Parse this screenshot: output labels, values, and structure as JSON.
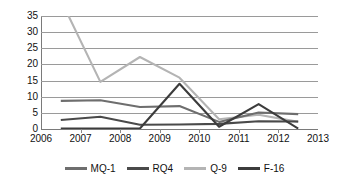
{
  "chart_data": {
    "type": "line",
    "title": "",
    "xlabel": "",
    "ylabel": "",
    "xlim": [
      2006,
      2013
    ],
    "ylim": [
      0,
      35
    ],
    "yticks": [
      0,
      5,
      10,
      15,
      20,
      25,
      30,
      35
    ],
    "xticks": [
      2006,
      2007,
      2008,
      2009,
      2010,
      2011,
      2012,
      2013
    ],
    "grid": true,
    "legend_position": "bottom",
    "note_clipped": "Q-9 value at 2006 exceeds the y-axis maximum of 35 and is clipped at the top of the plot area",
    "x": [
      2006,
      2007,
      2008,
      2009,
      2010,
      2011,
      2012
    ],
    "series": [
      {
        "name": "MQ-1",
        "color": "#6e6e6e",
        "values": [
          8.7,
          8.9,
          6.8,
          7.1,
          2.2,
          5.1,
          4.6
        ]
      },
      {
        "name": "RQ4",
        "color": "#4a4a4a",
        "values": [
          2.8,
          3.8,
          1.3,
          1.4,
          1.6,
          2.4,
          2.3
        ]
      },
      {
        "name": "Q-9",
        "color": "#b4b4b4",
        "values": [
          40.0,
          14.6,
          22.3,
          15.9,
          3.0,
          4.4,
          2.2
        ]
      },
      {
        "name": "F-16",
        "color": "#3c3c3c",
        "values": [
          0.15,
          0.15,
          0.15,
          14.0,
          0.7,
          7.7,
          0.15
        ]
      }
    ]
  },
  "legend": {
    "items": [
      {
        "label": "MQ-1",
        "color": "#6e6e6e"
      },
      {
        "label": "RQ4",
        "color": "#4a4a4a"
      },
      {
        "label": "Q-9",
        "color": "#b4b4b4"
      },
      {
        "label": "F-16",
        "color": "#3c3c3c"
      }
    ]
  },
  "axes": {
    "y_tick_labels": [
      "35",
      "30",
      "25",
      "20",
      "15",
      "10",
      "5",
      "0"
    ],
    "x_tick_labels": [
      "2006",
      "2007",
      "2008",
      "2009",
      "2010",
      "2011",
      "2012",
      "2013"
    ]
  }
}
